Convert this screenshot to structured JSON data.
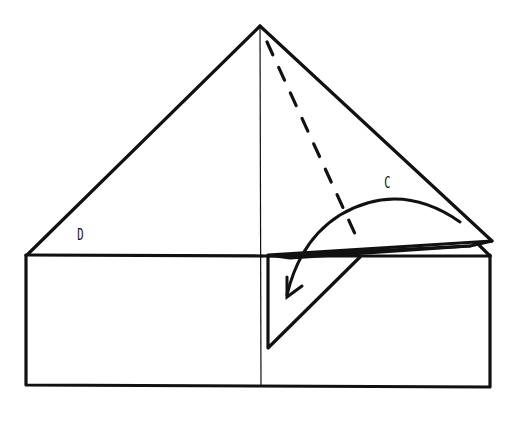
{
  "diagram": {
    "type": "origami-fold-instruction",
    "labels": {
      "left_flap": "D",
      "right_flap": "C"
    },
    "colors": {
      "line": "#111111",
      "background": "#ffffff"
    }
  }
}
